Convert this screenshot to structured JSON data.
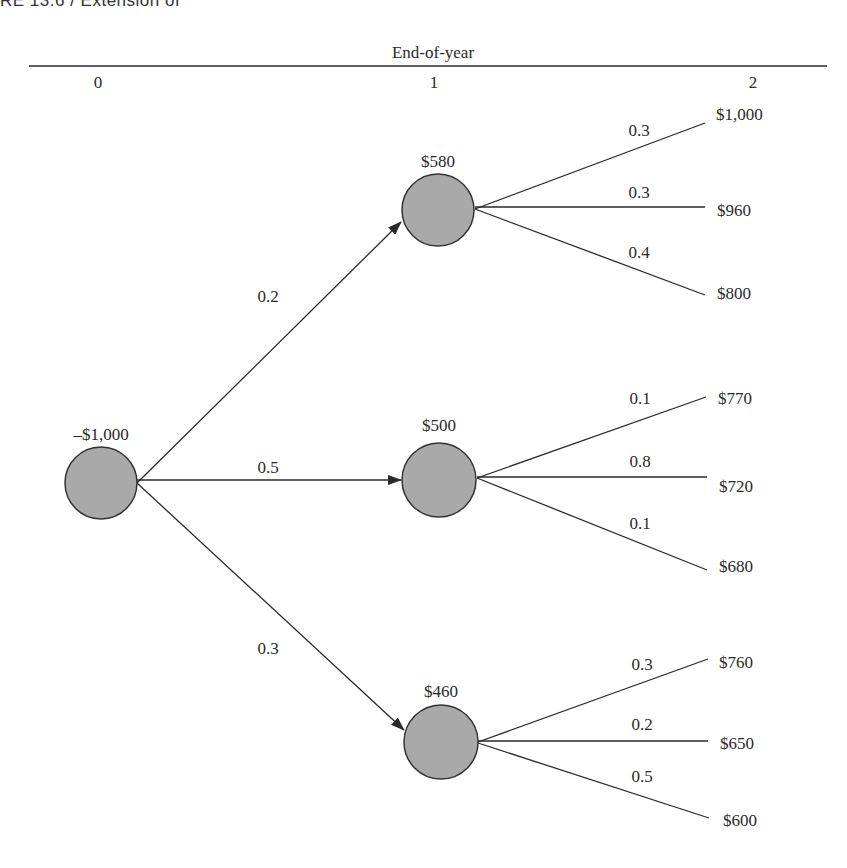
{
  "running_header": "RE 13.6  /  Extension of",
  "timeline": {
    "title": "End-of-year",
    "periods": [
      "0",
      "1",
      "2"
    ]
  },
  "colors": {
    "node_fill": "#a9a9a9",
    "node_stroke": "#333333",
    "line": "#2a2a2a"
  },
  "tree": {
    "root": {
      "label": "–$1,000"
    },
    "branches": [
      {
        "probability": "0.2",
        "node_label": "$580",
        "outcomes": [
          {
            "probability": "0.3",
            "value": "$1,000"
          },
          {
            "probability": "0.3",
            "value": "$960"
          },
          {
            "probability": "0.4",
            "value": "$800"
          }
        ]
      },
      {
        "probability": "0.5",
        "node_label": "$500",
        "outcomes": [
          {
            "probability": "0.1",
            "value": "$770"
          },
          {
            "probability": "0.8",
            "value": "$720"
          },
          {
            "probability": "0.1",
            "value": "$680"
          }
        ]
      },
      {
        "probability": "0.3",
        "node_label": "$460",
        "outcomes": [
          {
            "probability": "0.3",
            "value": "$760"
          },
          {
            "probability": "0.2",
            "value": "$650"
          },
          {
            "probability": "0.5",
            "value": "$600"
          }
        ]
      }
    ]
  }
}
